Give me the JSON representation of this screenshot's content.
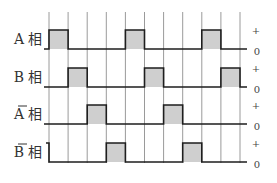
{
  "diagram": {
    "type": "timing-diagram",
    "phases": [
      {
        "id": "A",
        "label": "A 相",
        "letter": "A",
        "suffix": "相",
        "overline": false,
        "high_slots": [
          0,
          4,
          8
        ]
      },
      {
        "id": "B",
        "label": "B 相",
        "letter": "B",
        "suffix": "相",
        "overline": false,
        "high_slots": [
          1,
          5,
          9
        ]
      },
      {
        "id": "A_bar",
        "label": "Ā 相",
        "letter": "A",
        "suffix": "相",
        "overline": true,
        "high_slots": [
          2,
          6
        ]
      },
      {
        "id": "B_bar",
        "label": "B̄ 相",
        "letter": "B",
        "suffix": "相",
        "overline": true,
        "high_slots": [
          3,
          7
        ],
        "initial_high_tail": true
      }
    ],
    "level_labels": {
      "high": "+",
      "low": "0"
    },
    "time_slots": 10,
    "colors": {
      "pulse_fill": "#cfcfcf",
      "line": "#1e1e1e",
      "grid": "#9a9a9a"
    }
  }
}
